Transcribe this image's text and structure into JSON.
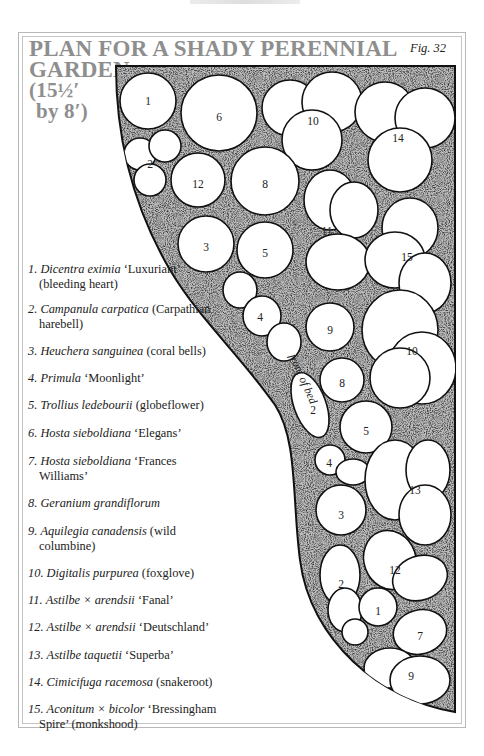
{
  "figure": {
    "title_lines": [
      "PLAN FOR A SHADY PERENNIAL",
      "GARDEN",
      "(15½′",
      "by 8′)"
    ],
    "fig_label": "Fig. 32",
    "bed_label": "front of bed",
    "colors": {
      "title": "#8e8e8e",
      "frame": "#b8b8b8",
      "ink": "#1a1a1a",
      "stipple": "#9a9a9a"
    }
  },
  "legend": [
    {
      "num": "1.",
      "sci": "Dicentra eximia",
      "rest": " ‘Luxuriant’",
      "cont": "(bleeding heart)"
    },
    {
      "num": "2.",
      "sci": "Campanula carpatica",
      "rest": " (Carpathian",
      "cont": "harebell)"
    },
    {
      "num": "3.",
      "sci": "Heuchera sanguinea",
      "rest": " (coral bells)",
      "cont": ""
    },
    {
      "num": "4.",
      "sci": "Primula",
      "rest": " ‘Moonlight’",
      "cont": ""
    },
    {
      "num": "5.",
      "sci": "Trollius ledebourii",
      "rest": " (globeflower)",
      "cont": ""
    },
    {
      "num": "6.",
      "sci": "Hosta sieboldiana",
      "rest": " ‘Elegans’",
      "cont": ""
    },
    {
      "num": "7.",
      "sci": "Hosta sieboldiana",
      "rest": " ‘Frances",
      "cont": "Williams’"
    },
    {
      "num": "8.",
      "sci": "Geranium grandiflorum",
      "rest": "",
      "cont": ""
    },
    {
      "num": "9.",
      "sci": "Aquilegia canadensis",
      "rest": " (wild",
      "cont": "columbine)"
    },
    {
      "num": "10.",
      "sci": "Digitalis purpurea",
      "rest": " (foxglove)",
      "cont": ""
    },
    {
      "num": "11.",
      "sci": "Astilbe × arendsii",
      "rest": " ‘Fanal’",
      "cont": ""
    },
    {
      "num": "12.",
      "sci": "Astilbe × arendsii",
      "rest": " ‘Deutschland’",
      "cont": ""
    },
    {
      "num": "13.",
      "sci": "Astilbe taquetii",
      "rest": " ‘Superba’",
      "cont": ""
    },
    {
      "num": "14.",
      "sci": "Cimicifuga racemosa",
      "rest": " (snakeroot)",
      "cont": ""
    },
    {
      "num": "15.",
      "sci": "Aconitum × bicolor",
      "rest": " ‘Bressingham",
      "cont": "Spire’ (monkshood)"
    }
  ],
  "plan_labels": [
    {
      "id": "1",
      "x": 148,
      "y": 101
    },
    {
      "id": "6",
      "x": 219,
      "y": 117
    },
    {
      "id": "10",
      "x": 313,
      "y": 121
    },
    {
      "id": "14",
      "x": 398,
      "y": 138
    },
    {
      "id": "2",
      "x": 150,
      "y": 164
    },
    {
      "id": "12",
      "x": 198,
      "y": 184
    },
    {
      "id": "8",
      "x": 265,
      "y": 184
    },
    {
      "id": "11",
      "x": 327,
      "y": 231
    },
    {
      "id": "3",
      "x": 206,
      "y": 247
    },
    {
      "id": "5",
      "x": 265,
      "y": 253
    },
    {
      "id": "15",
      "x": 407,
      "y": 257
    },
    {
      "id": "4",
      "x": 260,
      "y": 317
    },
    {
      "id": "9",
      "x": 330,
      "y": 330
    },
    {
      "id": "10",
      "x": 412,
      "y": 351
    },
    {
      "id": "8",
      "x": 342,
      "y": 383
    },
    {
      "id": "2",
      "x": 313,
      "y": 410
    },
    {
      "id": "5",
      "x": 366,
      "y": 431
    },
    {
      "id": "4",
      "x": 329,
      "y": 463
    },
    {
      "id": "13",
      "x": 415,
      "y": 490
    },
    {
      "id": "3",
      "x": 341,
      "y": 515
    },
    {
      "id": "12",
      "x": 395,
      "y": 570
    },
    {
      "id": "2",
      "x": 341,
      "y": 584
    },
    {
      "id": "1",
      "x": 378,
      "y": 611
    },
    {
      "id": "7",
      "x": 420,
      "y": 636
    },
    {
      "id": "9",
      "x": 411,
      "y": 676
    }
  ]
}
